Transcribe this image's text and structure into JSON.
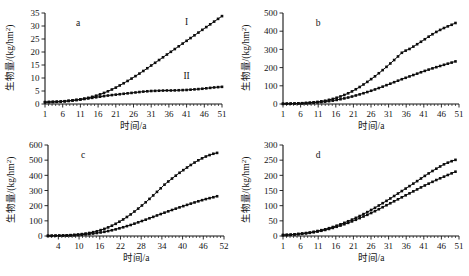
{
  "figure": {
    "panel_count": 4,
    "axis_titles": {
      "x": "时间/a",
      "y": "生物量/(kg/hm2)",
      "y_unit_base": "生物量/(kg/hm",
      "y_unit_sup": "2",
      "y_unit_tail": ")"
    }
  },
  "chart_data": [
    {
      "type": "line",
      "panel": "a",
      "title": "a",
      "xlabel": "时间/a",
      "ylabel": "生物量/(kg/hm2)",
      "xlim": [
        1,
        51
      ],
      "ylim": [
        0,
        35
      ],
      "xticks": [
        1,
        6,
        11,
        16,
        21,
        26,
        31,
        36,
        41,
        46,
        51
      ],
      "yticks": [
        0,
        5,
        10,
        15,
        20,
        25,
        30,
        35
      ],
      "grid": false,
      "legend": "inline-annotation",
      "x": [
        1,
        3,
        5,
        7,
        9,
        11,
        13,
        15,
        17,
        19,
        21,
        23,
        25,
        27,
        29,
        31,
        33,
        35,
        37,
        39,
        41,
        43,
        45,
        47,
        49,
        51
      ],
      "series": [
        {
          "name": "I",
          "label_x": 41,
          "label_y": 30.5,
          "values": [
            0.7,
            0.8,
            0.9,
            1.1,
            1.4,
            1.8,
            2.3,
            3.0,
            3.9,
            5.0,
            6.3,
            7.8,
            9.4,
            11.1,
            12.9,
            14.8,
            16.7,
            18.6,
            20.5,
            22.4,
            24.3,
            26.2,
            28.1,
            30.0,
            31.9,
            33.8
          ]
        },
        {
          "name": "II",
          "label_x": 41,
          "label_y": 9.5,
          "values": [
            0.7,
            0.8,
            0.9,
            1.1,
            1.4,
            1.7,
            2.1,
            2.5,
            2.9,
            3.3,
            3.6,
            3.9,
            4.2,
            4.5,
            4.8,
            5.0,
            5.1,
            5.2,
            5.2,
            5.3,
            5.4,
            5.6,
            5.8,
            6.1,
            6.4,
            6.6
          ]
        }
      ]
    },
    {
      "type": "line",
      "panel": "b",
      "title": "b",
      "xlabel": "时间/a",
      "ylabel": "生物量/(kg/hm2)",
      "xlim": [
        1,
        51
      ],
      "ylim": [
        0,
        500
      ],
      "xticks": [
        1,
        6,
        11,
        16,
        21,
        26,
        31,
        36,
        41,
        46,
        51
      ],
      "yticks": [
        0,
        100,
        200,
        300,
        400,
        500
      ],
      "grid": false,
      "legend": "none",
      "x": [
        1,
        3,
        5,
        7,
        9,
        11,
        13,
        15,
        17,
        19,
        21,
        23,
        25,
        27,
        29,
        31,
        33,
        35,
        37,
        39,
        41,
        43,
        45,
        47,
        49,
        50
      ],
      "series": [
        {
          "name": "upper",
          "values": [
            1,
            2,
            3,
            5,
            8,
            12,
            18,
            27,
            39,
            54,
            73,
            96,
            122,
            150,
            181,
            214,
            249,
            286,
            303,
            327,
            352,
            378,
            401,
            420,
            436,
            445
          ]
        },
        {
          "name": "lower",
          "values": [
            1,
            2,
            3,
            4,
            6,
            9,
            13,
            18,
            25,
            33,
            43,
            54,
            66,
            79,
            93,
            108,
            123,
            138,
            152,
            166,
            180,
            193,
            205,
            217,
            228,
            234
          ]
        }
      ]
    },
    {
      "type": "line",
      "panel": "c",
      "title": "c",
      "xlabel": "时间/a",
      "ylabel": "生物量/(kg/hm2)",
      "xlim": [
        1,
        52
      ],
      "ylim": [
        0,
        600
      ],
      "xticks": [
        4,
        10,
        16,
        22,
        28,
        34,
        40,
        46,
        52
      ],
      "yticks": [
        0,
        100,
        200,
        300,
        400,
        500,
        600
      ],
      "grid": false,
      "legend": "none",
      "x": [
        1,
        3,
        5,
        7,
        9,
        11,
        13,
        15,
        17,
        19,
        21,
        23,
        25,
        27,
        29,
        31,
        33,
        35,
        37,
        39,
        41,
        43,
        45,
        47,
        49,
        50
      ],
      "series": [
        {
          "name": "upper",
          "values": [
            1,
            2,
            3,
            5,
            8,
            13,
            20,
            30,
            44,
            62,
            85,
            112,
            143,
            178,
            216,
            257,
            300,
            344,
            380,
            415,
            447,
            478,
            505,
            527,
            543,
            548
          ]
        },
        {
          "name": "lower",
          "values": [
            1,
            2,
            3,
            4,
            6,
            9,
            13,
            19,
            26,
            35,
            46,
            59,
            73,
            89,
            105,
            122,
            139,
            156,
            172,
            188,
            203,
            218,
            232,
            245,
            256,
            262
          ]
        }
      ]
    },
    {
      "type": "line",
      "panel": "d",
      "title": "d",
      "xlabel": "时间/a",
      "ylabel": "生物量/(kg/hm2)",
      "xlim": [
        1,
        51
      ],
      "ylim": [
        0,
        300
      ],
      "xticks": [
        1,
        6,
        11,
        16,
        21,
        26,
        31,
        36,
        41,
        46,
        51
      ],
      "yticks": [
        0,
        50,
        100,
        150,
        200,
        250,
        300
      ],
      "grid": false,
      "legend": "none",
      "x": [
        1,
        3,
        5,
        7,
        9,
        11,
        13,
        15,
        17,
        19,
        21,
        23,
        25,
        27,
        29,
        31,
        33,
        35,
        37,
        39,
        41,
        43,
        45,
        47,
        49,
        50
      ],
      "series": [
        {
          "name": "upper",
          "values": [
            3,
            4,
            6,
            9,
            12,
            17,
            22,
            29,
            37,
            46,
            56,
            67,
            79,
            92,
            106,
            120,
            135,
            150,
            165,
            180,
            196,
            211,
            225,
            238,
            247,
            251
          ]
        },
        {
          "name": "lower",
          "values": [
            3,
            4,
            6,
            8,
            11,
            15,
            20,
            26,
            33,
            41,
            50,
            60,
            70,
            81,
            93,
            105,
            117,
            129,
            141,
            153,
            165,
            176,
            187,
            197,
            207,
            212
          ]
        }
      ]
    }
  ]
}
